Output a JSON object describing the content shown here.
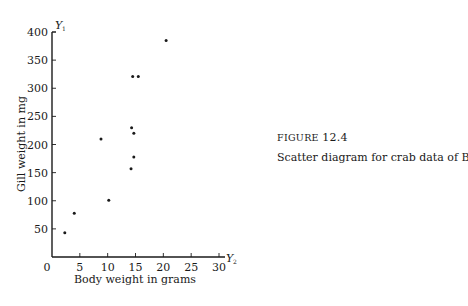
{
  "figure": {
    "label": "FIGURE",
    "number": "12.4",
    "caption": "Scatter diagram for crab data of Box 12.1."
  },
  "chart_data": {
    "type": "scatter",
    "title": "",
    "xlabel": "Body weight in grams",
    "ylabel": "Gill weight in mg",
    "x_axis_symbol": "Y",
    "x_axis_subscript": "2",
    "y_axis_symbol": "Y",
    "y_axis_subscript": "1",
    "xlim": [
      0,
      30
    ],
    "ylim": [
      0,
      400
    ],
    "x_ticks": [
      0,
      5,
      10,
      15,
      20,
      25,
      30
    ],
    "y_ticks": [
      50,
      100,
      150,
      200,
      250,
      300,
      350,
      400
    ],
    "grid": false,
    "legend": null,
    "points": [
      {
        "x": 2.3,
        "y": 43
      },
      {
        "x": 4.0,
        "y": 78
      },
      {
        "x": 8.8,
        "y": 210
      },
      {
        "x": 10.2,
        "y": 101
      },
      {
        "x": 14.2,
        "y": 157
      },
      {
        "x": 14.3,
        "y": 230
      },
      {
        "x": 14.5,
        "y": 321
      },
      {
        "x": 14.7,
        "y": 178
      },
      {
        "x": 14.7,
        "y": 220
      },
      {
        "x": 15.5,
        "y": 321
      },
      {
        "x": 20.5,
        "y": 385
      }
    ]
  },
  "colors": {
    "ink": "#1a1a1a",
    "background": "#ffffff"
  }
}
